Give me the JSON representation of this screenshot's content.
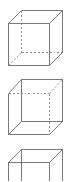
{
  "diagram": {
    "type": "wireframe-cubes",
    "stroke_color": "#7a7a7a",
    "hidden_stroke_color": "#8c8c8c",
    "cubes": [
      {
        "id": "cube-1",
        "description": "Cube viewed from above-right; hidden edges at back-left-bottom are dashed",
        "front": {
          "x1": 8,
          "y1": 23,
          "x2": 49,
          "y2": 65
        },
        "back": {
          "x1": 21,
          "y1": 10,
          "x2": 62,
          "y2": 52
        },
        "hidden_edges": [
          "back-left",
          "back-bottom",
          "diag-bottom-left"
        ]
      },
      {
        "id": "cube-2",
        "description": "Cube viewed from below-left; hidden edges at front-top-right are dashed",
        "front": {
          "x1": 8,
          "y1": 93,
          "x2": 49,
          "y2": 134
        },
        "back": {
          "x1": 21,
          "y1": 79,
          "x2": 62,
          "y2": 121
        },
        "hidden_edges": [
          "front-top",
          "front-right",
          "diag-top-right"
        ]
      },
      {
        "id": "cube-3",
        "description": "Cube with all edges drawn solid (partially cropped at bottom)",
        "front": {
          "x1": 8,
          "y1": 162,
          "x2": 49,
          "y2": 203
        },
        "back": {
          "x1": 21,
          "y1": 149,
          "x2": 62,
          "y2": 190
        },
        "hidden_edges": []
      }
    ]
  }
}
